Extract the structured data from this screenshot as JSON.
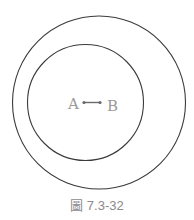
{
  "figure": {
    "caption": "圖 7.3-32",
    "labels": {
      "a": "A",
      "b": "B"
    },
    "outer_circle": {
      "cx": 99,
      "cy": 102.5,
      "r": 86.5
    },
    "inner_circle": {
      "cx": 85.5,
      "cy": 102.5,
      "r": 58
    },
    "segment": {
      "x1": 84,
      "y1": 102.5,
      "x2": 100,
      "y2": 102.5
    },
    "colors": {
      "stroke": "#3a3a3a",
      "label": "#9a9a9a",
      "segment": "#6a6a6a"
    }
  }
}
